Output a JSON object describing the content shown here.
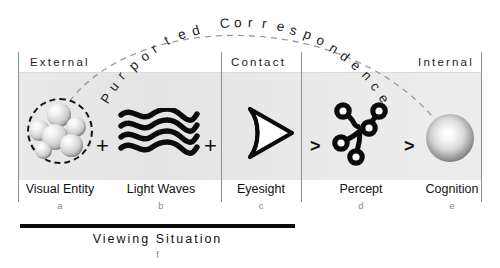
{
  "diagram": {
    "arc_label": "Purported Correspondence",
    "sections": [
      {
        "id": "external",
        "label": "External"
      },
      {
        "id": "contact",
        "label": "Contact"
      },
      {
        "id": "internal",
        "label": "Internal"
      }
    ],
    "stages": [
      {
        "key": "visual-entity",
        "label": "Visual Entity",
        "sub": "a",
        "icon": "molecule-cluster-icon"
      },
      {
        "key": "light-waves",
        "label": "Light Waves",
        "sub": "b",
        "icon": "light-waves-icon"
      },
      {
        "key": "eyesight",
        "label": "Eyesight",
        "sub": "c",
        "icon": "eye-cone-icon"
      },
      {
        "key": "percept",
        "label": "Percept",
        "sub": "d",
        "icon": "neural-node-graph-icon"
      },
      {
        "key": "cognition",
        "label": "Cognition",
        "sub": "e",
        "icon": "sphere-icon"
      }
    ],
    "operators": [
      {
        "key": "op1",
        "symbol": "+"
      },
      {
        "key": "op2",
        "symbol": "+"
      },
      {
        "key": "op3",
        "symbol": ">"
      },
      {
        "key": "op4",
        "symbol": ">"
      }
    ],
    "footer": {
      "label": "Viewing Situation",
      "sub": "f"
    },
    "colors": {
      "ink": "#111111",
      "band": "#e9e9e9",
      "rule": "#8d8d8d",
      "sub_text": "#8a8a8a",
      "arc_dash": "#9a9a9a"
    }
  }
}
